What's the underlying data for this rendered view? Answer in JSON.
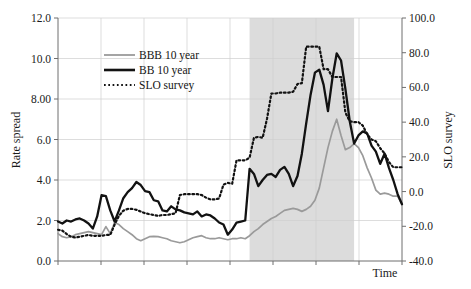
{
  "chart_data": {
    "type": "line",
    "title": "",
    "xlabel": "Time",
    "ylabel": "Rate spread",
    "y2label": "SLO survey",
    "ylim": [
      0.0,
      12.0
    ],
    "y2lim": [
      -40.0,
      100.0
    ],
    "grid": true,
    "legend_position": "upper-left-inside",
    "y_tick_labels": [
      "12.0",
      "10.0",
      "8.00",
      "6.0",
      "4.0",
      "2.0",
      "0.0"
    ],
    "y_tick_values": [
      12.0,
      10.0,
      8.0,
      6.0,
      4.0,
      2.0,
      0.0
    ],
    "y2_tick_labels": [
      "100.0",
      "80.0",
      "60.0",
      "40.0",
      "20.0",
      "0.0",
      "-20.0",
      "-40.0"
    ],
    "y2_tick_values": [
      100.0,
      80.0,
      60.0,
      40.0,
      20.0,
      0.0,
      -20.0,
      -40.0
    ],
    "x_tick_labels": [
      "",
      "",
      "",
      "",
      "",
      "",
      "",
      ""
    ],
    "x_index_count": 80,
    "annotations": [
      {
        "type": "shaded-band",
        "name": "recession-shading",
        "x_start_index": 44,
        "x_end_index": 68,
        "color": "#d6d6d6"
      }
    ],
    "series": [
      {
        "name": "BBB 10 year",
        "axis": "left",
        "style": "solid",
        "color": "#9a9a9a",
        "width": 1.7,
        "values": [
          1.35,
          1.2,
          1.15,
          1.2,
          1.3,
          1.35,
          1.4,
          1.45,
          1.4,
          1.35,
          1.3,
          1.7,
          1.35,
          1.9,
          1.8,
          1.6,
          1.45,
          1.3,
          1.1,
          1.0,
          1.1,
          1.2,
          1.22,
          1.2,
          1.15,
          1.1,
          1.0,
          0.95,
          0.9,
          0.95,
          1.05,
          1.15,
          1.2,
          1.25,
          1.15,
          1.1,
          1.1,
          1.15,
          1.1,
          1.05,
          1.1,
          1.1,
          1.15,
          1.1,
          1.25,
          1.45,
          1.6,
          1.8,
          1.95,
          2.1,
          2.2,
          2.35,
          2.5,
          2.55,
          2.6,
          2.55,
          2.45,
          2.55,
          2.7,
          3.0,
          3.6,
          4.6,
          5.6,
          6.4,
          7.0,
          6.2,
          5.5,
          5.6,
          5.8,
          5.6,
          5.2,
          4.6,
          4.1,
          3.5,
          3.3,
          3.35,
          3.3,
          3.2,
          3.2,
          2.8
        ]
      },
      {
        "name": "BB 10 year",
        "axis": "left",
        "style": "solid",
        "color": "#121212",
        "width": 2.3,
        "values": [
          1.95,
          1.85,
          2.0,
          1.95,
          2.05,
          2.1,
          2.0,
          1.85,
          1.6,
          2.2,
          3.25,
          3.2,
          2.5,
          1.95,
          2.5,
          3.1,
          3.4,
          3.6,
          3.9,
          3.75,
          3.45,
          3.4,
          3.0,
          2.95,
          2.5,
          2.45,
          2.7,
          2.55,
          2.5,
          2.4,
          2.35,
          2.3,
          2.45,
          2.2,
          2.3,
          2.25,
          2.1,
          1.9,
          1.8,
          1.3,
          1.55,
          1.9,
          1.95,
          2.0,
          4.55,
          4.3,
          3.7,
          4.0,
          4.25,
          4.3,
          4.15,
          4.5,
          4.65,
          4.3,
          3.7,
          4.2,
          5.3,
          6.8,
          8.2,
          9.3,
          9.45,
          8.7,
          7.4,
          9.0,
          10.25,
          9.9,
          8.5,
          6.9,
          5.8,
          6.2,
          6.4,
          6.3,
          5.7,
          5.4,
          4.8,
          5.3,
          4.6,
          4.0,
          3.3,
          2.8
        ]
      },
      {
        "name": "SLO survey",
        "axis": "right",
        "style": "dotted",
        "color": "#121212",
        "width": 2.2,
        "values": [
          -22.0,
          -22.5,
          -24.5,
          -26.0,
          -26.5,
          -26.0,
          -25.5,
          -25.0,
          -25.5,
          -25.5,
          -25.5,
          -25.0,
          -25.0,
          -19.0,
          -14.0,
          -11.0,
          -10.0,
          -10.0,
          -10.5,
          -11.5,
          -12.5,
          -13.0,
          -13.5,
          -14.0,
          -13.5,
          -13.5,
          -13.0,
          -12.5,
          -2.0,
          -1.5,
          -1.5,
          -1.5,
          -1.5,
          -2.0,
          -3.5,
          -4.5,
          -4.5,
          -4.0,
          4.0,
          5.0,
          4.5,
          18.0,
          18.0,
          18.0,
          19.5,
          31.0,
          31.5,
          31.0,
          42.0,
          56.5,
          56.5,
          57.0,
          57.0,
          57.0,
          57.5,
          62.0,
          62.5,
          83.5,
          83.5,
          83.5,
          83.5,
          70.5,
          70.5,
          66.0,
          66.0,
          66.0,
          45.5,
          40.5,
          40.0,
          40.0,
          38.0,
          33.0,
          30.0,
          29.0,
          25.0,
          22.0,
          17.0,
          14.0,
          14.0,
          14.0
        ]
      }
    ]
  },
  "legend": {
    "items": [
      {
        "label": "BBB 10 year",
        "style": "solid",
        "color": "#9a9a9a"
      },
      {
        "label": "BB 10 year",
        "style": "solid",
        "color": "#121212"
      },
      {
        "label": "SLO survey",
        "style": "dotted",
        "color": "#121212"
      }
    ]
  },
  "axes": {
    "left_title": "Rate spread",
    "right_title": "SLO survey",
    "bottom_title": "Time"
  }
}
